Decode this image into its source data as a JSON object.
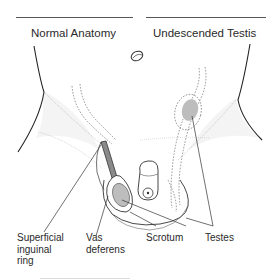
{
  "diagram": {
    "titles": {
      "left": "Normal Anatomy",
      "right": "Undescended Testis"
    },
    "labels": {
      "superficial_inguinal_ring": "Superficial\ninguinal\nring",
      "vas_deferens": "Vas\ndeferens",
      "scrotum": "Scrotum",
      "testes": "Testes"
    },
    "colors": {
      "line": "#333333",
      "dotted": "#777777",
      "testis_fill": "#bdbdbd",
      "vas_fill": "#8a8a8a",
      "stipple": "#9a9a9a"
    }
  }
}
